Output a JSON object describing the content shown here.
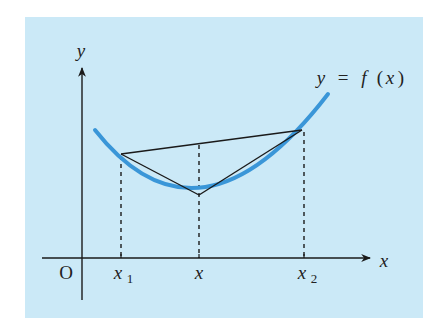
{
  "diagram": {
    "background_color": "#cbe9f7",
    "curve_color": "#3a96d8",
    "line_color": "#1a1a1a",
    "axes": {
      "x_label": "x",
      "y_label": "y",
      "origin_label": "O"
    },
    "curve_label": "y = f (x)",
    "curve_label_parts": {
      "y": "y",
      "eq": "=",
      "f": "f",
      "lparen": "(",
      "x": "x",
      "rparen": ")"
    },
    "ticks": [
      {
        "label": "x",
        "sub": "1",
        "px": 121
      },
      {
        "label": "x",
        "sub": "",
        "px": 199
      },
      {
        "label": "x",
        "sub": "2",
        "px": 304
      }
    ],
    "points": {
      "A": {
        "px": 121,
        "py": 154,
        "desc": "point on curve at x1"
      },
      "M": {
        "px": 199,
        "py": 195,
        "desc": "point on curve at x"
      },
      "B": {
        "px": 302,
        "py": 130,
        "desc": "point on curve at x2"
      },
      "chord_at_x": {
        "px": 199,
        "py": 143
      }
    }
  }
}
